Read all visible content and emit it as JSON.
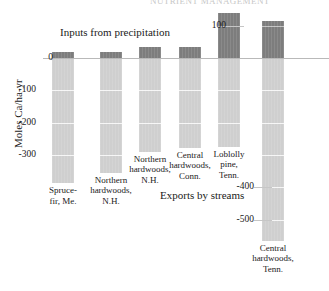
{
  "figure": {
    "cut_off_header": "NUTRIENT MANAGEMENT",
    "ylabel": "Moles Ca/ha-yr",
    "annotation_inputs": "Inputs from precipitation",
    "annotation_exports": "Exports by streams"
  },
  "chart_data": {
    "type": "bar",
    "title": "",
    "subtitle": "",
    "xlabel": "",
    "ylabel": "Moles Ca/ha-yr",
    "ylim": [
      -600,
      160
    ],
    "grid": true,
    "legend_position": "none",
    "annotations": [
      {
        "text": "Inputs from precipitation",
        "x": 0.35,
        "y": 90
      },
      {
        "text": "Exports by streams",
        "x": 0.6,
        "y": -430
      }
    ],
    "yticks_left": [
      0,
      -100,
      -200,
      -300
    ],
    "yticks_left_labels": [
      "0",
      "-100",
      "-200",
      "-300"
    ],
    "yticks_right": [
      100,
      -400,
      -500
    ],
    "yticks_right_labels": [
      "100",
      "-400",
      "-500"
    ],
    "categories": [
      "Spruce-\nfir, Me.",
      "Northern\nhardwoods,\nN.H.",
      "Northern\nhardwoods,\nN.H.",
      "Central\nhardwoods,\nConn.",
      "Loblolly\npine,\nTenn.",
      "Central\nhardwoods,\nTenn."
    ],
    "series": [
      {
        "name": "Inputs from precipitation",
        "color": "#7d7d7d",
        "values": [
          18,
          18,
          35,
          33,
          139,
          115
        ]
      },
      {
        "name": "Exports by streams",
        "color": "#cfcfcf",
        "values": [
          -387,
          -355,
          -290,
          -278,
          -275,
          -566
        ]
      }
    ]
  },
  "bars": [
    {
      "label": "Spruce-\nfir, Me.",
      "input": 18,
      "export": -387
    },
    {
      "label": "Northern\nhardwoods,\nN.H.",
      "input": 18,
      "export": -355
    },
    {
      "label": "Northern\nhardwoods,\nN.H.",
      "input": 35,
      "export": -290
    },
    {
      "label": "Central\nhardwoods,\nConn.",
      "input": 33,
      "export": -278
    },
    {
      "label": "Loblolly\npine,\nTenn.",
      "input": 139,
      "export": -275
    },
    {
      "label": "Central\nhardwoods,\nTenn.",
      "input": 115,
      "export": -566
    }
  ],
  "axis": {
    "left_ticks": [
      {
        "value": "0"
      },
      {
        "value": "-100"
      },
      {
        "value": "-200"
      },
      {
        "value": "-300"
      }
    ],
    "right_ticks": [
      {
        "value": "100"
      },
      {
        "value": "-400"
      },
      {
        "value": "-500"
      }
    ]
  }
}
